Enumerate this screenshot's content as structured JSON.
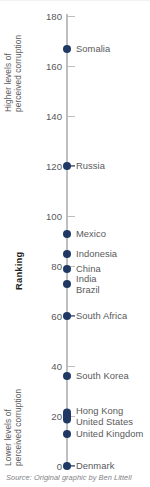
{
  "chart_data": {
    "type": "scatter",
    "title": "",
    "xlabel": "",
    "ylabel": "Ranking",
    "ylim": [
      0,
      180
    ],
    "grid": false,
    "legend": null,
    "orientation": "vertical-single-axis",
    "tick_values": [
      0,
      20,
      40,
      60,
      80,
      100,
      120,
      140,
      160,
      180
    ],
    "tick_labels": [
      "0",
      "20",
      "40",
      "60",
      "80",
      "100",
      "120",
      "140",
      "160",
      "180"
    ],
    "annotations": {
      "top": "Higher levels of perceived corruption",
      "bottom": "Lower levels of perceived corruption"
    },
    "categories": [
      "Somalia",
      "Russia",
      "Mexico",
      "Indonesia",
      "China",
      "India",
      "Brazil",
      "South Africa",
      "South Korea",
      "Hong Kong",
      "United States",
      "United Kingdom",
      "Denmark"
    ],
    "values": [
      167,
      120,
      93,
      85,
      79,
      73,
      73,
      60,
      36,
      21,
      19,
      13,
      0
    ],
    "source": "Source: Original graphic by Ben Littell"
  },
  "axis": {
    "title": "Ranking",
    "note_high_line1": "Higher levels of",
    "note_high_line2": "perceived corruption",
    "note_low_line1": "Lower levels of",
    "note_low_line2": "perceived corruption",
    "ticks": [
      {
        "label": "180"
      },
      {
        "label": "160"
      },
      {
        "label": "140"
      },
      {
        "label": "120"
      },
      {
        "label": "100"
      },
      {
        "label": "80"
      },
      {
        "label": "60"
      },
      {
        "label": "40"
      },
      {
        "label": "20"
      },
      {
        "label": "0"
      }
    ]
  },
  "points": [
    {
      "label": "Somalia"
    },
    {
      "label": "Russia"
    },
    {
      "label": "Mexico"
    },
    {
      "label": "Indonesia"
    },
    {
      "label": "China"
    },
    {
      "label": "India"
    },
    {
      "label": "Brazil"
    },
    {
      "label": "South Africa"
    },
    {
      "label": "South Korea"
    },
    {
      "label": "Hong Kong"
    },
    {
      "label": "United States"
    },
    {
      "label": "United Kingdom"
    },
    {
      "label": "Denmark"
    }
  ],
  "caption": {
    "text": "Source: Original graphic by Ben Littell"
  },
  "colors": {
    "dot": "#1f3864",
    "axis": "#bcbec0",
    "text": "#58595b",
    "title": "#231f20",
    "caption": "#808285"
  }
}
